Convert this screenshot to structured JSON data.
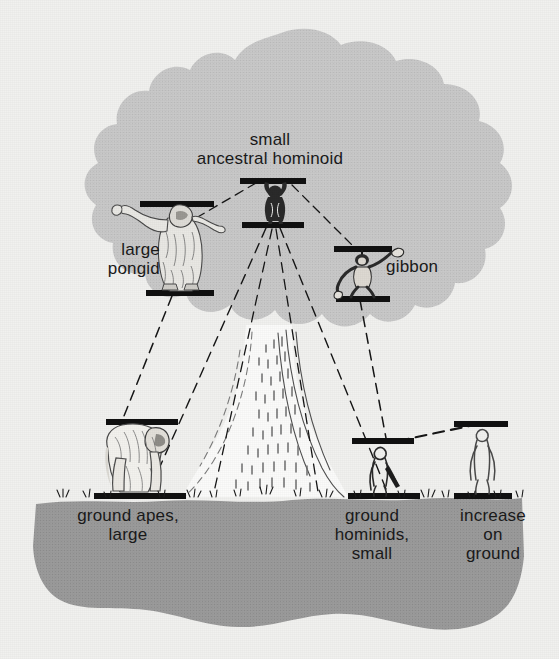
{
  "figure": {
    "kind": "scientific-illustration",
    "background_color": "#f1f1ef",
    "canopy_color": "#c9c9c9",
    "ground_color": "#9b9b9b",
    "ink_color": "#1a1a1a"
  },
  "labels": {
    "ancestral": "small\nancestral hominoid",
    "pongid": "large\npongid",
    "gibbon": "gibbon",
    "ground_apes": "ground apes,\nlarge",
    "ground_hominids": "ground\nhominids,\nsmall",
    "increase": "increase\non\nground"
  },
  "nodes": [
    {
      "id": "ancestral",
      "label_key": "ancestral",
      "x": 272,
      "y": 205,
      "zone": "canopy",
      "bars": [
        "top",
        "bottom"
      ]
    },
    {
      "id": "large-pongid",
      "label_key": "pongid",
      "x": 175,
      "y": 245,
      "zone": "canopy",
      "bars": [
        "top",
        "bottom"
      ]
    },
    {
      "id": "gibbon",
      "label_key": "gibbon",
      "x": 364,
      "y": 272,
      "zone": "canopy",
      "bars": [
        "top",
        "bottom"
      ]
    },
    {
      "id": "ground-apes",
      "label_key": "ground_apes",
      "x": 131,
      "y": 455,
      "zone": "ground",
      "bars": [
        "top",
        "ground"
      ]
    },
    {
      "id": "ground-hominids",
      "label_key": "ground_hominids",
      "x": 379,
      "y": 455,
      "zone": "ground",
      "bars": [
        "top",
        "ground"
      ]
    },
    {
      "id": "increase",
      "label_key": "increase",
      "x": 480,
      "y": 450,
      "zone": "ground",
      "bars": [
        "top",
        "ground"
      ]
    }
  ],
  "connections": [
    {
      "from": "ancestral",
      "to": "large-pongid",
      "style": "dashed"
    },
    {
      "from": "ancestral",
      "to": "gibbon",
      "style": "dashed"
    },
    {
      "from": "ancestral",
      "to": "ground-apes",
      "style": "dashed"
    },
    {
      "from": "ancestral",
      "to": "ground-hominids",
      "style": "dashed"
    },
    {
      "from": "large-pongid",
      "to": "ground-apes",
      "style": "dashed"
    },
    {
      "from": "gibbon",
      "to": "ground-hominids",
      "style": "dashed"
    },
    {
      "from": "ground-hominids",
      "to": "increase",
      "style": "dashed"
    }
  ]
}
